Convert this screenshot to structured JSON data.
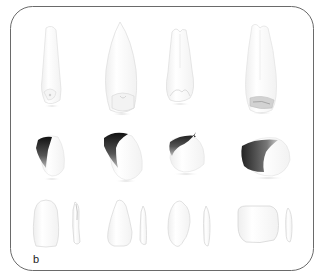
{
  "figure": {
    "panel_label": "b",
    "frame_color": "#6a6a6a",
    "tooth_fill": "#ffffff",
    "tooth_outline": "#dcdcdc",
    "dark_shade": "#1a1a1a",
    "rows": [
      {
        "name": "row-root-views",
        "items": [
          {
            "name": "central-incisor-root-view"
          },
          {
            "name": "canine-root-view"
          },
          {
            "name": "premolar-root-view"
          },
          {
            "name": "molar-root-view"
          }
        ]
      },
      {
        "name": "row-crown-perspective-views",
        "items": [
          {
            "name": "incisor-crown-perspective"
          },
          {
            "name": "canine-crown-perspective"
          },
          {
            "name": "premolar-crown-perspective"
          },
          {
            "name": "molar-crown-perspective"
          }
        ]
      },
      {
        "name": "row-crown-facial-proximal-views",
        "items": [
          {
            "name": "incisor-facial-proximal"
          },
          {
            "name": "canine-facial-proximal"
          },
          {
            "name": "premolar-facial-proximal"
          },
          {
            "name": "molar-facial-proximal"
          }
        ]
      }
    ]
  }
}
